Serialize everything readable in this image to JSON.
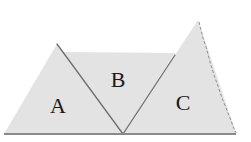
{
  "diagram": {
    "type": "geometry-figure",
    "colors": {
      "fill": "#e3e3e3",
      "cut_line": "#6f6f6f",
      "baseline": "#8a8a8a",
      "label": "#1a1a1a"
    },
    "pieces": [
      {
        "id": "A",
        "label": "A",
        "vertices": [
          [
            4,
            134
          ],
          [
            57,
            44
          ],
          [
            123,
            134
          ]
        ],
        "label_pos": [
          58,
          106
        ]
      },
      {
        "id": "B",
        "label": "B",
        "vertices": [
          [
            57,
            44
          ],
          [
            67,
            52
          ],
          [
            175,
            54
          ],
          [
            123,
            134
          ]
        ],
        "label_pos": [
          118,
          80
        ]
      },
      {
        "id": "C",
        "label": "C",
        "vertices": [
          [
            123,
            134
          ],
          [
            198,
            20
          ],
          [
            236,
            133
          ]
        ],
        "label_pos": [
          183,
          103
        ]
      }
    ],
    "baseline": {
      "from": [
        4,
        134
      ],
      "to": [
        236,
        134
      ]
    }
  }
}
